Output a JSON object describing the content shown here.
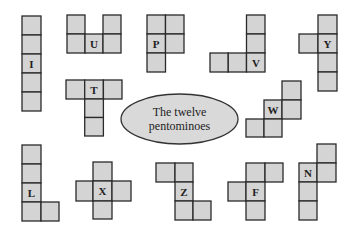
{
  "diagram": {
    "title_line1": "The twelve",
    "title_line2": "pentominoes",
    "colors": {
      "cell_fill": "#d4d4d4",
      "cell_stroke": "#2a2a2a",
      "ellipse_fill": "#d9d9d9",
      "background": "#ffffff"
    },
    "pieces": [
      {
        "letter": "I"
      },
      {
        "letter": "U"
      },
      {
        "letter": "P"
      },
      {
        "letter": "V"
      },
      {
        "letter": "Y"
      },
      {
        "letter": "T"
      },
      {
        "letter": "W"
      },
      {
        "letter": "L"
      },
      {
        "letter": "X"
      },
      {
        "letter": "Z"
      },
      {
        "letter": "F"
      },
      {
        "letter": "N"
      }
    ]
  }
}
